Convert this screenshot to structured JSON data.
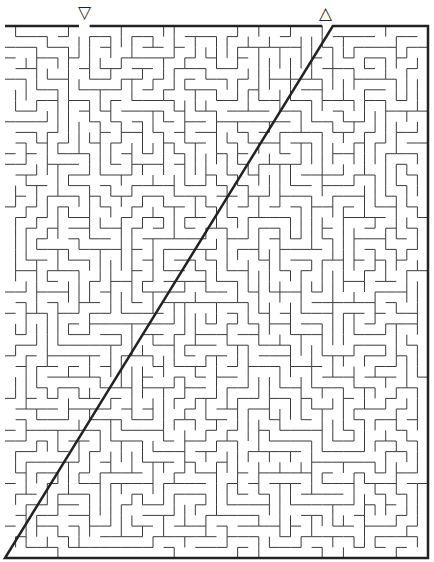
{
  "puzzle": {
    "type": "maze",
    "start_marker": "▽",
    "end_marker": "△",
    "start_label": "entrance",
    "end_label": "exit"
  },
  "maze": {
    "cols": 40,
    "rows": 50,
    "left": 5,
    "top": 26,
    "right": 428,
    "bottom": 558,
    "start_col": 7,
    "end_col": 30,
    "seed": 1337,
    "wall_color": "#3a3a3a",
    "border_color": "#222222",
    "background": "#ffffff"
  }
}
